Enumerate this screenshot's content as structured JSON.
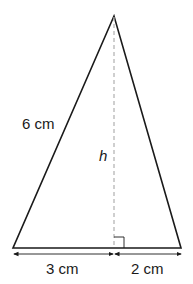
{
  "diagram": {
    "shape": "triangle",
    "labels": {
      "left_side": "6 cm",
      "height": "h",
      "base_left": "3 cm",
      "base_right": "2 cm"
    },
    "colors": {
      "stroke": "#1a1a1a",
      "height_line": "#b0b0b0",
      "text": "#1a1a1a"
    }
  }
}
